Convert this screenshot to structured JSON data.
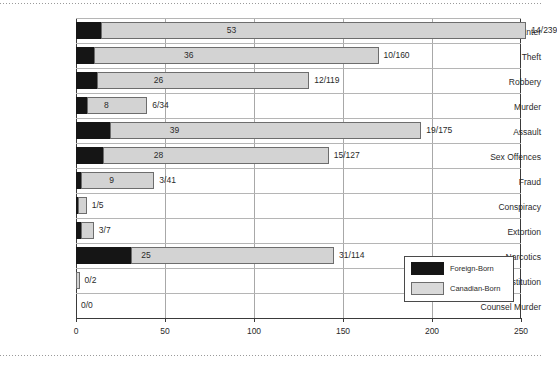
{
  "chart_data": {
    "type": "bar",
    "orientation": "horizontal",
    "stacked": true,
    "title": "",
    "xlabel": "",
    "ylabel": "",
    "xlim": [
      0,
      250
    ],
    "xticks": [
      0,
      50,
      100,
      150,
      200,
      250
    ],
    "xtick_labels": [
      "0",
      "50",
      "100",
      "150",
      "200",
      "250"
    ],
    "grid": true,
    "legend_position": "bottom-right",
    "categories": [
      "Break & Enter",
      "Theft",
      "Robbery",
      "Murder",
      "Assault",
      "Sex Offences",
      "Fraud",
      "Conspiracy",
      "Extortion",
      "Narcotics",
      "Prostitution",
      "Counsel Murder"
    ],
    "series": [
      {
        "name": "Foreign-Born",
        "color": "#151515",
        "values": [
          14,
          10,
          12,
          6,
          19,
          15,
          3,
          1,
          3,
          31,
          0,
          0
        ]
      },
      {
        "name": "Canadian-Born",
        "color": "#d3d3d3",
        "values": [
          239,
          160,
          119,
          34,
          175,
          127,
          41,
          5,
          7,
          114,
          2,
          0
        ]
      }
    ],
    "inner_labels": [
      "53",
      "36",
      "26",
      "8",
      "39",
      "28",
      "9",
      "",
      "",
      "25",
      "",
      ""
    ],
    "inner_label_x": [
      83,
      59,
      42,
      14,
      51,
      42,
      17,
      0,
      0,
      35,
      0,
      0
    ],
    "end_labels": [
      "14/239",
      "10/160",
      "12/119",
      "6/34",
      "19/175",
      "15/127",
      "3/41",
      "1/5",
      "3/7",
      "31/114",
      "0/2",
      "0/0"
    ]
  },
  "legend": {
    "items": [
      {
        "label": "Foreign-Born",
        "swatch": "fb"
      },
      {
        "label": "Canadian-Born",
        "swatch": "cb"
      }
    ]
  }
}
